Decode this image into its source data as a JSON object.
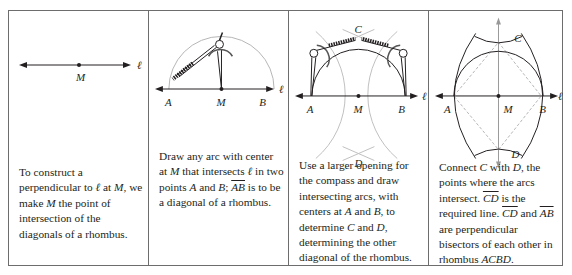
{
  "panels": [
    {
      "id": 1,
      "labels": {
        "line": "ℓ",
        "M": "M"
      },
      "caption": {
        "t1": "To construct a perpendicular to ",
        "l": "ℓ",
        "t2": " at ",
        "m1": "M",
        "t3": ", we make ",
        "m2": "M",
        "t4": " the point of intersection of the diagonals of a rhombus."
      }
    },
    {
      "id": 2,
      "labels": {
        "line": "ℓ",
        "A": "A",
        "M": "M",
        "B": "B"
      },
      "caption": {
        "t1": "Draw any arc with center at ",
        "m": "M",
        "t2": " that intersects ",
        "l": "ℓ",
        "t3": " in two points ",
        "a": "A",
        "t4": " and ",
        "b": "B",
        "t5": "; ",
        "ab": "AB",
        "t6": " is to be a diagonal of a rhombus."
      }
    },
    {
      "id": 3,
      "labels": {
        "line": "ℓ",
        "A": "A",
        "M": "M",
        "B": "B",
        "C": "C",
        "D": "D"
      },
      "caption": {
        "t1": "Use a larger opening for the compass and draw intersecting arcs, with centers at ",
        "a": "A",
        "t2": " and ",
        "b": "B",
        "t3": ", to determine ",
        "c": "C",
        "t4": " and ",
        "d": "D",
        "t5": ", determining the other diagonal of the rhombus."
      }
    },
    {
      "id": 4,
      "labels": {
        "line": "ℓ",
        "A": "A",
        "M": "M",
        "B": "B",
        "C": "C",
        "D": "D"
      },
      "caption": {
        "t1": "Connect ",
        "c": "C",
        "t2": " with ",
        "d": "D",
        "t3": ", the points where the arcs intersect. ",
        "cd1": "CD",
        "t4": " is the required line. ",
        "cd2": "CD",
        "t5": " and ",
        "ab": "AB",
        "t6": " are perpendicular bisectors of each other in rhombus ",
        "acbd": "ACBD",
        "t7": "."
      }
    }
  ]
}
